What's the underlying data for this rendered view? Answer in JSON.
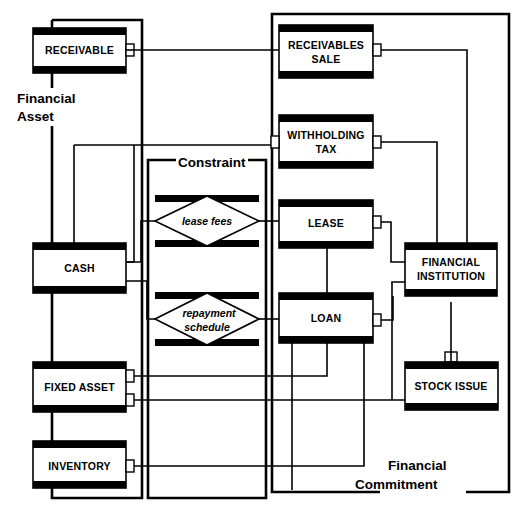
{
  "diagram": {
    "type": "entity-relationship-block-diagram",
    "colors": {
      "ink": "#000000",
      "paper": "#ffffff"
    },
    "groups": [
      {
        "id": "financial-asset",
        "label_line1": "Financial",
        "label_line2": "Asset",
        "label_position": "left-outside-top",
        "x": 18,
        "y": 20,
        "w": 124,
        "h": 478
      },
      {
        "id": "constraint",
        "label_line1": "Constraint",
        "label_line2": "",
        "label_position": "top-inline",
        "x": 148,
        "y": 160,
        "w": 118,
        "h": 338
      },
      {
        "id": "financial-commitment",
        "label_line1": "Financial",
        "label_line2": "Commitment",
        "label_position": "bottom-inline-right",
        "x": 266,
        "y": 14,
        "w": 243,
        "h": 478
      }
    ],
    "entities": [
      {
        "id": "receivable",
        "label": "RECEIVABLE",
        "lines": [
          "RECEIVABLE"
        ],
        "group": "financial-asset",
        "x": 33,
        "y": 28,
        "w": 93,
        "h": 45,
        "ports": [
          {
            "side": "right",
            "y": 50
          }
        ]
      },
      {
        "id": "cash",
        "label": "CASH",
        "lines": [
          "CASH"
        ],
        "group": "financial-asset",
        "x": 33,
        "y": 243,
        "w": 93,
        "h": 50,
        "ports": [
          {
            "side": "right",
            "y": 262
          },
          {
            "side": "right",
            "y": 281
          }
        ]
      },
      {
        "id": "fixed-asset",
        "label": "FIXED ASSET",
        "lines": [
          "FIXED ASSET"
        ],
        "group": "financial-asset",
        "x": 33,
        "y": 362,
        "w": 93,
        "h": 50,
        "ports": [
          {
            "side": "right",
            "y": 376
          },
          {
            "side": "right",
            "y": 400
          }
        ]
      },
      {
        "id": "inventory",
        "label": "INVENTORY",
        "lines": [
          "INVENTORY"
        ],
        "group": "financial-asset",
        "x": 33,
        "y": 441,
        "w": 93,
        "h": 47,
        "ports": [
          {
            "side": "right",
            "y": 466
          }
        ]
      },
      {
        "id": "receivables-sale",
        "label": "RECEIVABLES SALE",
        "lines": [
          "RECEIVABLES",
          "SALE"
        ],
        "group": "financial-commitment",
        "x": 279,
        "y": 25,
        "w": 94,
        "h": 53,
        "ports": [
          {
            "side": "right",
            "y": 50
          }
        ]
      },
      {
        "id": "withholding-tax",
        "label": "WITHHOLDING TAX",
        "lines": [
          "WITHHOLDING",
          "TAX"
        ],
        "group": "financial-commitment",
        "x": 279,
        "y": 115,
        "w": 94,
        "h": 53,
        "ports": [
          {
            "side": "left",
            "y": 142
          },
          {
            "side": "right",
            "y": 142
          }
        ]
      },
      {
        "id": "lease",
        "label": "LEASE",
        "lines": [
          "LEASE"
        ],
        "group": "financial-commitment",
        "x": 279,
        "y": 200,
        "w": 94,
        "h": 48,
        "ports": [
          {
            "side": "right",
            "y": 222
          }
        ]
      },
      {
        "id": "loan",
        "label": "LOAN",
        "lines": [
          "LOAN"
        ],
        "group": "financial-commitment",
        "x": 279,
        "y": 293,
        "w": 94,
        "h": 50,
        "ports": [
          {
            "side": "right",
            "y": 320
          }
        ]
      },
      {
        "id": "financial-institution",
        "label": "FINANCIAL INSTITUTION",
        "lines": [
          "FINANCIAL",
          "INSTITUTION"
        ],
        "group": "financial-commitment",
        "x": 405,
        "y": 243,
        "w": 92,
        "h": 53,
        "ports": [
          {
            "side": "bottom",
            "x": 451
          }
        ]
      },
      {
        "id": "stock-issue",
        "label": "STOCK ISSUE",
        "lines": [
          "STOCK ISSUE"
        ],
        "group": "financial-commitment",
        "x": 405,
        "y": 362,
        "w": 93,
        "h": 48,
        "ports": [
          {
            "side": "top",
            "x": 451
          }
        ]
      }
    ],
    "constraints": [
      {
        "id": "lease-fees",
        "label": "lease fees",
        "lines": [
          "lease fees"
        ],
        "group": "constraint",
        "x": 155,
        "y": 195,
        "w": 104,
        "h": 52
      },
      {
        "id": "repayment-schedule",
        "label": "repayment schedule",
        "lines": [
          "repayment",
          "schedule"
        ],
        "group": "constraint",
        "x": 155,
        "y": 292,
        "w": 104,
        "h": 54
      }
    ],
    "connections": [
      {
        "from": "receivable",
        "to": "receivables-sale"
      },
      {
        "from": "cash",
        "to": "withholding-tax"
      },
      {
        "from": "cash",
        "to": "lease-fees"
      },
      {
        "from": "cash",
        "to": "repayment-schedule"
      },
      {
        "from": "lease-fees",
        "to": "lease"
      },
      {
        "from": "repayment-schedule",
        "to": "loan"
      },
      {
        "from": "fixed-asset",
        "to": "lease"
      },
      {
        "from": "fixed-asset",
        "to": "loan"
      },
      {
        "from": "inventory",
        "to": "loan"
      },
      {
        "from": "receivables-sale",
        "to": "financial-institution"
      },
      {
        "from": "withholding-tax",
        "to": "financial-institution"
      },
      {
        "from": "lease",
        "to": "financial-institution"
      },
      {
        "from": "loan",
        "to": "financial-institution"
      },
      {
        "from": "financial-institution",
        "to": "stock-issue"
      }
    ]
  }
}
